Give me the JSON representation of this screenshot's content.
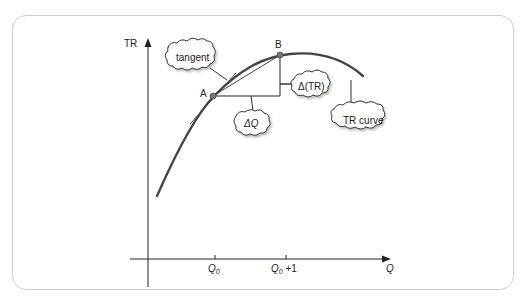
{
  "figure": {
    "y_axis_label": "TR",
    "x_axis_label": "Q",
    "x_ticks": [
      {
        "label": "Q",
        "sub": "0",
        "suffix": ""
      },
      {
        "label": "Q",
        "sub": "0",
        "suffix": " +1"
      }
    ],
    "points": [
      {
        "name": "A"
      },
      {
        "name": "B"
      }
    ],
    "callouts": {
      "tangent": "tangent",
      "delta_q": "ΔQ",
      "delta_tr": "Δ(TR)",
      "tr_curve": "TR curve"
    },
    "colors": {
      "curve": "#444444",
      "point": "#777777",
      "axis": "#222222",
      "panel_border": "#cfcfcf"
    }
  }
}
